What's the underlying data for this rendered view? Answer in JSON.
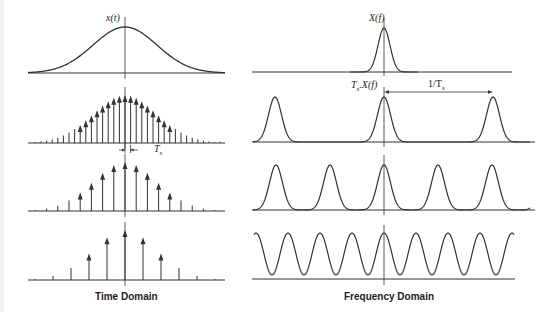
{
  "figure": {
    "time_domain": {
      "caption": "Time Domain",
      "signal_label": "x(t)",
      "period_label_main": "T",
      "period_label_sub": "s",
      "rows": [
        {
          "type": "continuous",
          "description": "Gaussian pulse x(t)"
        },
        {
          "type": "impulse_train",
          "spacing_px": 5.6,
          "description": "Dense sampling"
        },
        {
          "type": "impulse_train",
          "spacing_px": 11.2,
          "description": "Moderate sampling"
        },
        {
          "type": "impulse_train",
          "spacing_px": 18.0,
          "description": "Sparse sampling"
        }
      ]
    },
    "frequency_domain": {
      "caption": "Frequency Domain",
      "spectrum_label": "X(f)",
      "scaled_label_main": "T",
      "scaled_label_sub": "s",
      "scaled_label_rest": ".X(f)",
      "period_label_prefix": "1/T",
      "period_label_sub": "s",
      "rows": [
        {
          "type": "single_spectrum",
          "description": "Spectrum X(f)"
        },
        {
          "type": "replicas",
          "spacing_px": 109,
          "description": "Widely separated replicas"
        },
        {
          "type": "replicas",
          "spacing_px": 54,
          "description": "Closer replicas"
        },
        {
          "type": "overlapping",
          "spacing_px": 32,
          "description": "Overlapping replicas (aliasing)"
        }
      ]
    },
    "colors": {
      "line": "#333333",
      "background": "#ffffff"
    }
  }
}
